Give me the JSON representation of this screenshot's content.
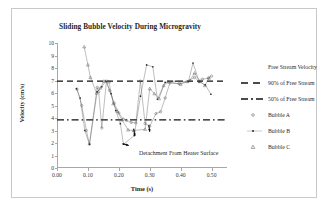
{
  "chart_data": {
    "type": "scatter",
    "title": "Sliding Bubble Velocity During Microgravity",
    "xlabel": "Time (s)",
    "ylabel": "Velocity (cm/s)",
    "xlim": [
      0.0,
      0.55
    ],
    "ylim": [
      0,
      10
    ],
    "xticks": [
      "0.00",
      "0.10",
      "0.20",
      "0.30",
      "0.40",
      "0.50"
    ],
    "xtick_values": [
      0.0,
      0.1,
      0.2,
      0.3,
      0.4,
      0.5
    ],
    "yticks": [
      "0",
      "1",
      "2",
      "3",
      "4",
      "5",
      "6",
      "7",
      "8",
      "9",
      "10"
    ],
    "ytick_values": [
      0,
      1,
      2,
      3,
      4,
      5,
      6,
      7,
      8,
      9,
      10
    ],
    "grid": false,
    "legend_position": "right",
    "reference_lines": [
      {
        "name": "90% of Free Stream",
        "y": 6.95,
        "style": "dashed"
      },
      {
        "name": "50% of Free Stream",
        "y": 3.85,
        "style": "dash-dot"
      }
    ],
    "annotations": [
      {
        "text": "Detachment From Heater Surface",
        "x": 0.255,
        "y": 1.55
      }
    ],
    "series": [
      {
        "name": "Bubble A",
        "marker": "open-circle",
        "points": [
          [
            0.065,
            6.3
          ],
          [
            0.08,
            5.0
          ],
          [
            0.095,
            3.0
          ],
          [
            0.105,
            1.9
          ],
          [
            0.13,
            6.45
          ],
          [
            0.135,
            6.1
          ],
          [
            0.145,
            3.2
          ],
          [
            0.16,
            6.95
          ],
          [
            0.17,
            6.2
          ],
          [
            0.185,
            5.2
          ],
          [
            0.2,
            4.4
          ],
          [
            0.215,
            3.9
          ],
          [
            0.225,
            3.8
          ],
          [
            0.24,
            3.65
          ],
          [
            0.255,
            3.6
          ],
          [
            0.27,
            6.95
          ],
          [
            0.285,
            3.55
          ],
          [
            0.3,
            3.35
          ],
          [
            0.32,
            4.35
          ],
          [
            0.335,
            4.5
          ],
          [
            0.35,
            5.6
          ],
          [
            0.365,
            6.8
          ],
          [
            0.395,
            6.75
          ],
          [
            0.42,
            6.9
          ],
          [
            0.445,
            7.25
          ],
          [
            0.46,
            6.9
          ],
          [
            0.47,
            7.1
          ],
          [
            0.49,
            7.2
          ],
          [
            0.5,
            7.35
          ]
        ]
      },
      {
        "name": "Bubble B",
        "marker": "filled-dot",
        "points": [
          [
            0.063,
            6.35
          ],
          [
            0.075,
            5.6
          ],
          [
            0.09,
            3.0
          ],
          [
            0.105,
            1.9
          ],
          [
            0.13,
            6.1
          ],
          [
            0.145,
            6.5
          ],
          [
            0.158,
            6.95
          ],
          [
            0.175,
            5.95
          ],
          [
            0.19,
            4.6
          ],
          [
            0.205,
            3.55
          ],
          [
            0.215,
            1.9
          ],
          [
            0.25,
            2.6
          ],
          [
            0.27,
            5.75
          ],
          [
            0.29,
            8.25
          ],
          [
            0.31,
            8.1
          ],
          [
            0.325,
            5.5
          ],
          [
            0.35,
            6.85
          ],
          [
            0.385,
            6.95
          ],
          [
            0.425,
            6.9
          ],
          [
            0.44,
            8.4
          ],
          [
            0.46,
            6.9
          ],
          [
            0.48,
            6.65
          ],
          [
            0.498,
            5.9
          ]
        ]
      },
      {
        "name": "Bubble C",
        "marker": "open-triangle",
        "points": [
          [
            0.088,
            9.7
          ],
          [
            0.1,
            8.25
          ],
          [
            0.108,
            7.25
          ],
          [
            0.128,
            6.0
          ],
          [
            0.14,
            6.4
          ],
          [
            0.152,
            6.95
          ],
          [
            0.168,
            6.9
          ],
          [
            0.182,
            5.15
          ],
          [
            0.195,
            4.55
          ],
          [
            0.21,
            3.85
          ],
          [
            0.23,
            3.05
          ],
          [
            0.248,
            3.0
          ],
          [
            0.285,
            3.1
          ],
          [
            0.3,
            6.35
          ],
          [
            0.315,
            5.95
          ],
          [
            0.33,
            5.55
          ],
          [
            0.345,
            6.6
          ],
          [
            0.36,
            6.9
          ],
          [
            0.4,
            6.7
          ],
          [
            0.43,
            7.0
          ],
          [
            0.445,
            7.6
          ],
          [
            0.462,
            6.95
          ],
          [
            0.478,
            6.6
          ],
          [
            0.492,
            7.2
          ]
        ]
      }
    ]
  },
  "legend": {
    "title": "Free Stream Velocity",
    "items": [
      {
        "label": "90% of Free Stream",
        "marker": "dashed-line"
      },
      {
        "label": "50% of Free Stream",
        "marker": "dash-dot-line"
      },
      {
        "label": "Bubble A",
        "marker": "open-circle"
      },
      {
        "label": "Bubble B",
        "marker": "filled-dot"
      },
      {
        "label": "Bubble C",
        "marker": "open-triangle"
      }
    ]
  },
  "colors": {
    "axis": "#a8a8a8",
    "text": "#1f1f1f",
    "series": "#555555",
    "reference": "#111111"
  }
}
